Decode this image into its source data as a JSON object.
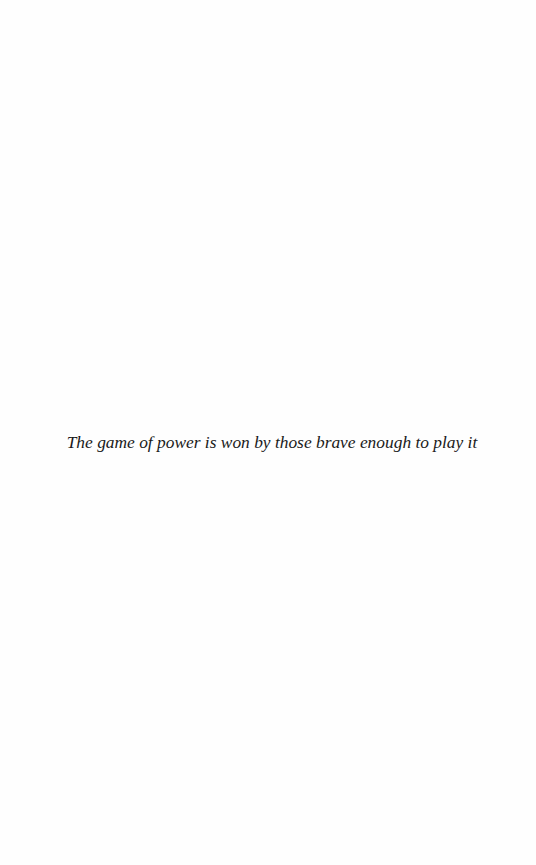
{
  "page": {
    "background": "#fefefe",
    "epigraph": "The game of power is won by those brave enough to play it"
  }
}
